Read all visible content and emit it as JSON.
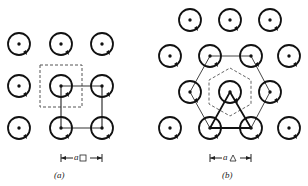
{
  "figure": {
    "panels": [
      {
        "id": "a",
        "caption": "(a)",
        "lattice": "square",
        "scale_label": "a",
        "scale_subscript": "□",
        "vortices": [
          [
            19,
            44
          ],
          [
            61,
            44
          ],
          [
            102,
            44
          ],
          [
            19,
            86
          ],
          [
            61,
            86
          ],
          [
            102,
            86
          ],
          [
            19,
            128
          ],
          [
            61,
            128
          ],
          [
            102,
            128
          ]
        ],
        "wigner_seitz_cell": "dashed square",
        "unit_cell": "solid square"
      },
      {
        "id": "b",
        "caption": "(b)",
        "lattice": "triangular",
        "scale_label": "a",
        "scale_subscript": "△",
        "vortices": [
          [
            190,
            20
          ],
          [
            230,
            20
          ],
          [
            270,
            20
          ],
          [
            170,
            56
          ],
          [
            210,
            56
          ],
          [
            251,
            56
          ],
          [
            289,
            56
          ],
          [
            190,
            92
          ],
          [
            230,
            92
          ],
          [
            270,
            92
          ],
          [
            170,
            128
          ],
          [
            210,
            128
          ],
          [
            251,
            128
          ],
          [
            289,
            128
          ]
        ],
        "wigner_seitz_cell": "dashed hexagon",
        "unit_cell": "solid triangle",
        "outer_hexagon": "solid hexagon"
      }
    ]
  }
}
